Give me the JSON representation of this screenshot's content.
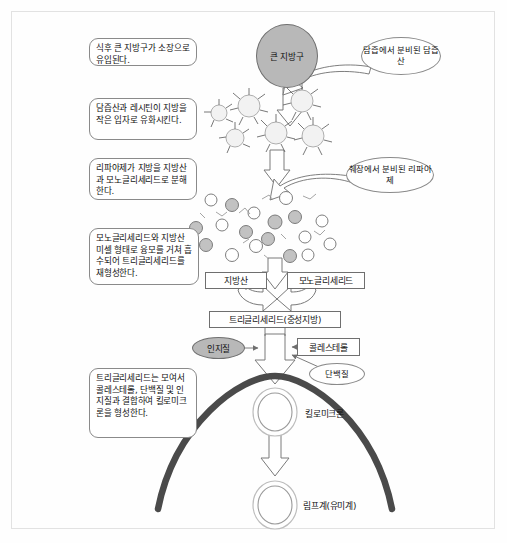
{
  "diagram": {
    "title_hidden": "",
    "callouts": [
      {
        "id": "c1",
        "text": "식후 큰 지방구가 소장으로 유입된다."
      },
      {
        "id": "c2",
        "text": "담즙산과 레시틴이 지방을 작은 입자로 유화시킨다."
      },
      {
        "id": "c3",
        "text": "리파아제가 지방을 지방산과 모노글리세리드로 분해한다."
      },
      {
        "id": "c4",
        "text": "모노글리세리드와 지방산 미셀 형태로 융모를 거쳐 흡수되어 트리글리세리드를 재형성한다."
      },
      {
        "id": "c5",
        "text": "트리글리세리드는 모여서 콜레스테롤, 단백질 및 인지질과 결합하여 킬로미크론을 형성한다."
      }
    ],
    "nodes": {
      "fat_globule": "큰 지방구",
      "bile_acid": "담즙에서 분비된 담즙산",
      "lipase": "췌장에서 분비된 리파아제",
      "fatty_acid": "지방산",
      "monoglyceride": "모노글리세리드",
      "triglyceride": "트리글리세리드(중성지방)",
      "phospholipid": "인지질",
      "cholesterol": "콜레스테롤",
      "protein": "단백질",
      "chylomicron": "킬로미크론",
      "lymph": "림프계(유미계)"
    },
    "colors": {
      "fill_gray": "#b8b8b8",
      "stroke": "#6f6f6f",
      "wall": "#4a4a4a",
      "frame": "#e2e2e2",
      "background": "#fefefe"
    }
  }
}
